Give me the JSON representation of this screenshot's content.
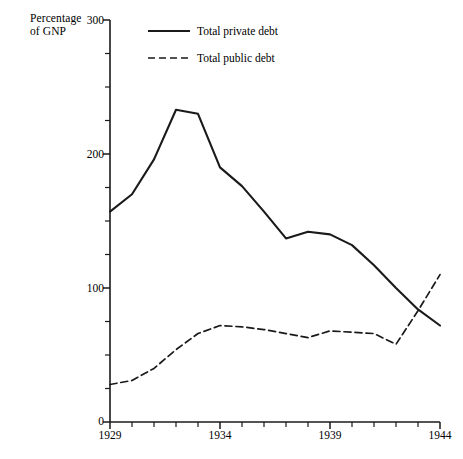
{
  "chart_data": {
    "type": "line",
    "title": "",
    "xlabel": "",
    "ylabel": "Percentage of GNP",
    "ylabel_line1": "Percentage",
    "ylabel_line2": "of GNP",
    "xlim": [
      1929,
      1944
    ],
    "ylim": [
      0,
      300
    ],
    "ytick_labels": [
      "0",
      "100",
      "200",
      "300"
    ],
    "ytick_values": [
      0,
      100,
      200,
      300
    ],
    "yminor_step": 25,
    "xtick_labels": [
      "1929",
      "1934",
      "1939",
      "1944"
    ],
    "xtick_values": [
      1929,
      1934,
      1939,
      1944
    ],
    "xminor_step": 1,
    "grid": false,
    "legend_position": "top-center",
    "x": [
      1929,
      1930,
      1931,
      1932,
      1933,
      1934,
      1935,
      1936,
      1937,
      1938,
      1939,
      1940,
      1941,
      1942,
      1943,
      1944
    ],
    "series": [
      {
        "name": "Total private debt",
        "style": "solid",
        "color": "#1a1a1a",
        "values": [
          157,
          170,
          196,
          233,
          230,
          190,
          176,
          157,
          137,
          142,
          140,
          132,
          117,
          100,
          84,
          72
        ]
      },
      {
        "name": "Total public debt",
        "style": "dashed",
        "color": "#1a1a1a",
        "values": [
          28,
          31,
          40,
          54,
          66,
          72,
          71,
          69,
          66,
          63,
          68,
          67,
          66,
          58,
          83,
          110
        ]
      }
    ]
  },
  "legend": {
    "items": [
      {
        "label": "Total private debt",
        "style": "solid"
      },
      {
        "label": "Total public debt",
        "style": "dashed"
      }
    ]
  }
}
